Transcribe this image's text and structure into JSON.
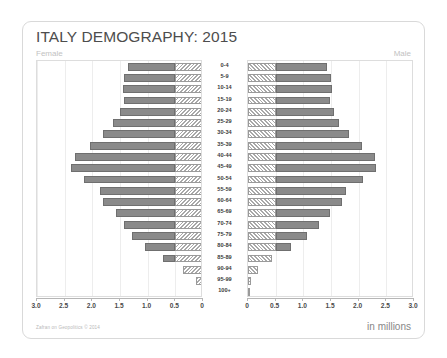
{
  "card": {
    "title": "ITALY DEMOGRAPHY: 2015",
    "female_label": "Female",
    "male_label": "Male",
    "credit": "Zafran on Geopolitics © 2014",
    "units": "in millions"
  },
  "chart_data": {
    "type": "bar",
    "subtype": "population-pyramid",
    "title": "ITALY DEMOGRAPHY: 2015",
    "xlabel": "in millions",
    "ylabel": "Age group",
    "units": "millions",
    "grid": true,
    "legend_position": "none",
    "xlim": [
      0,
      3.0
    ],
    "axis_direction": "female decreasing right-to-left, male increasing left-to-right",
    "tick_values": [
      3.0,
      2.5,
      2.0,
      1.5,
      1.0,
      0.5,
      0
    ],
    "female_tick_labels": [
      "3.0",
      "2.5",
      "2.0",
      "1.5",
      "1.0",
      "0.5",
      "0"
    ],
    "male_tick_labels": [
      "0",
      "0.5",
      "1.0",
      "1.5",
      "2.0",
      "2.5",
      "3.0"
    ],
    "categories": [
      "100+",
      "95-99",
      "90-94",
      "85-89",
      "80-84",
      "75-79",
      "70-74",
      "65-69",
      "60-64",
      "55-59",
      "50-54",
      "45-49",
      "40-44",
      "35-39",
      "30-34",
      "25-29",
      "20-24",
      "15-19",
      "10-14",
      "5-9",
      "0-4"
    ],
    "series": [
      {
        "name": "Female",
        "side": "left",
        "color": "#8a8a8a",
        "values": [
          0.02,
          0.12,
          0.36,
          0.72,
          1.05,
          1.28,
          1.42,
          1.58,
          1.8,
          1.86,
          2.15,
          2.38,
          2.32,
          2.05,
          1.8,
          1.62,
          1.5,
          1.42,
          1.45,
          1.42,
          1.35
        ]
      },
      {
        "name": "Male",
        "side": "right",
        "color": "#7a7a7a",
        "values": [
          0.01,
          0.05,
          0.18,
          0.44,
          0.78,
          1.07,
          1.28,
          1.48,
          1.7,
          1.78,
          2.08,
          2.32,
          2.3,
          2.06,
          1.82,
          1.65,
          1.55,
          1.48,
          1.52,
          1.5,
          1.42
        ]
      }
    ],
    "segmentation": {
      "description": "Each bar is split into an inner hatched segment nearest the centre axis and an outer solid grey segment.",
      "inner_hatched_extent": 0.5,
      "inner_style": "diagonal-hatch",
      "outer_style": "solid"
    }
  }
}
